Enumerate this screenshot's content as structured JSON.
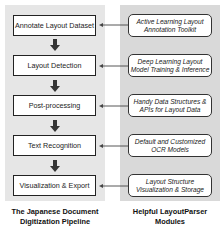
{
  "pipeline": {
    "caption_line1": "The Japanese Document",
    "caption_line2": "Digitization Pipeline",
    "stages": [
      {
        "label": "Annotate Layout Dataset"
      },
      {
        "label": "Layout Detection"
      },
      {
        "label": "Post-processing"
      },
      {
        "label": "Text Recognition"
      },
      {
        "label": "Visualization & Export"
      }
    ]
  },
  "modules": {
    "caption_line1": "Helpful LayoutParser",
    "caption_line2": "Modules",
    "items": [
      {
        "line1": "Active Learning Layout",
        "line2": "Annotation Toolkit"
      },
      {
        "line1": "Deep Learning Layout",
        "line2": "Model Training & Inference"
      },
      {
        "line1": "Handy Data Structures &",
        "line2": "APIs for Layout Data"
      },
      {
        "line1": "Default and Customized",
        "line2": "OCR Models"
      },
      {
        "line1": "Layout Structure",
        "line2": "Visualization & Storage"
      }
    ]
  },
  "colors": {
    "left_panel": "#e6e6e6",
    "right_panel": "#d9d9d9",
    "stroke": "#222222"
  }
}
